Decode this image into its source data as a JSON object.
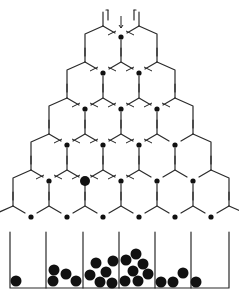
{
  "colors": {
    "background": "#ffffff",
    "line": "#2a2a2a",
    "ball": "#111111"
  },
  "geometry": {
    "width": 239,
    "height": 297,
    "apex_x": 121,
    "row_dy": 36,
    "col_dx": 54,
    "first_row_y": 46,
    "rows": 6,
    "bin_top_y": 232,
    "bin_bottom_y": 288,
    "bin_left_x": 10,
    "bin_right_x": 229,
    "bin_dividers_x": [
      46,
      83,
      119,
      155,
      191
    ],
    "bins": 6
  },
  "active_ball": {
    "row": 4,
    "col": 1,
    "label": "falling-ball"
  },
  "settled_balls": [
    {
      "x": 16,
      "y": 281,
      "r": 5.5
    },
    {
      "x": 53,
      "y": 281,
      "r": 5.5
    },
    {
      "x": 54,
      "y": 270,
      "r": 5.5
    },
    {
      "x": 66,
      "y": 274,
      "r": 5.5
    },
    {
      "x": 76,
      "y": 281,
      "r": 5.5
    },
    {
      "x": 90,
      "y": 275,
      "r": 5.5
    },
    {
      "x": 96,
      "y": 263,
      "r": 5.5
    },
    {
      "x": 100,
      "y": 282,
      "r": 5.5
    },
    {
      "x": 106,
      "y": 272,
      "r": 5.5
    },
    {
      "x": 112,
      "y": 283,
      "r": 5.5
    },
    {
      "x": 113,
      "y": 261,
      "r": 5.5
    },
    {
      "x": 125,
      "y": 281,
      "r": 5.5
    },
    {
      "x": 126,
      "y": 260,
      "r": 5.5
    },
    {
      "x": 133,
      "y": 271,
      "r": 5.5
    },
    {
      "x": 136,
      "y": 254,
      "r": 5.5
    },
    {
      "x": 138,
      "y": 281,
      "r": 5.5
    },
    {
      "x": 143,
      "y": 264,
      "r": 5.5
    },
    {
      "x": 148,
      "y": 274,
      "r": 5.5
    },
    {
      "x": 161,
      "y": 282,
      "r": 5.5
    },
    {
      "x": 173,
      "y": 282,
      "r": 5.5
    },
    {
      "x": 183,
      "y": 273,
      "r": 5.5
    },
    {
      "x": 196,
      "y": 282,
      "r": 5.5
    }
  ]
}
